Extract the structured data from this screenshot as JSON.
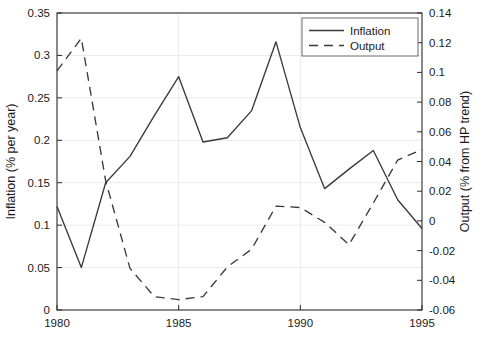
{
  "chart_data": {
    "type": "line",
    "title": "",
    "xlabel": "",
    "ylabel": "Inflation (% per year)",
    "y2label": "Output (% from HP trend)",
    "x": [
      1980,
      1981,
      1982,
      1983,
      1984,
      1985,
      1986,
      1987,
      1988,
      1989,
      1990,
      1991,
      1992,
      1993,
      1994,
      1995
    ],
    "xlim": [
      1980,
      1995
    ],
    "ylim": [
      0,
      0.35
    ],
    "y2lim": [
      -0.06,
      0.14
    ],
    "xticks": [
      1980,
      1985,
      1990,
      1995
    ],
    "xtick_labels": [
      "1980",
      "1985",
      "1990",
      "1995"
    ],
    "yticks": [
      0,
      0.05,
      0.1,
      0.15,
      0.2,
      0.25,
      0.3,
      0.35
    ],
    "ytick_labels": [
      "0",
      "0.05",
      "0.1",
      "0.15",
      "0.2",
      "0.25",
      "0.3",
      "0.35"
    ],
    "y2ticks": [
      -0.06,
      -0.04,
      -0.02,
      0,
      0.02,
      0.04,
      0.06,
      0.08,
      0.1,
      0.12,
      0.14
    ],
    "y2tick_labels": [
      "-0.06",
      "-0.04",
      "-0.02",
      "0",
      "0.02",
      "0.04",
      "0.06",
      "0.08",
      "0.1",
      "0.12",
      "0.14"
    ],
    "grid": true,
    "grid_axis": "y",
    "legend_position": "top-right",
    "series": [
      {
        "name": "Inflation",
        "axis": "left",
        "style": "solid",
        "color": "#3a3a3a",
        "values": [
          0.122,
          0.05,
          0.15,
          0.181,
          0.229,
          0.275,
          0.198,
          0.203,
          0.235,
          0.316,
          0.215,
          0.143,
          0.166,
          0.188,
          0.13,
          0.096
        ]
      },
      {
        "name": "Output",
        "axis": "right",
        "style": "dashed",
        "color": "#3a3a3a",
        "values": [
          0.101,
          0.123,
          0.027,
          -0.032,
          -0.051,
          -0.053,
          -0.051,
          -0.031,
          -0.019,
          0.01,
          0.009,
          -0.001,
          -0.016,
          0.012,
          0.041,
          0.048
        ]
      }
    ]
  },
  "legend": {
    "entries": [
      {
        "label": "Inflation",
        "style": "solid"
      },
      {
        "label": "Output",
        "style": "dashed"
      }
    ]
  },
  "caption": {
    "text": ""
  },
  "colors": {
    "line": "#3a3a3a",
    "axis": "#2b2b2b",
    "grid": "#eaeaea",
    "background": "#ffffff"
  }
}
